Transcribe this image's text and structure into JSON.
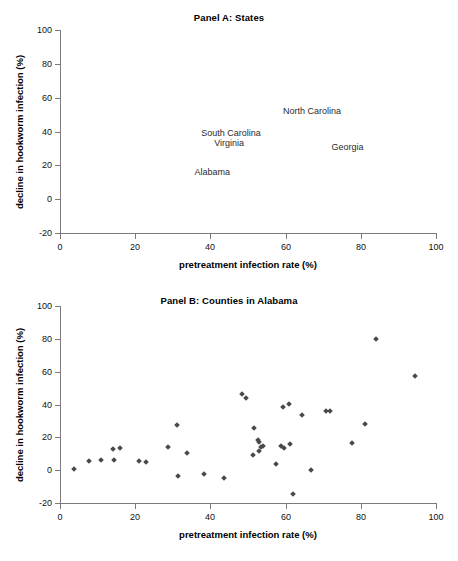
{
  "figure": {
    "panel_a": {
      "title": "Panel A: States",
      "xlabel": "pretreatment infection rate (%)",
      "ylabel": "decline in hookworm infection (%)",
      "xticks": [
        "0",
        "20",
        "40",
        "60",
        "80",
        "100"
      ],
      "yticks": [
        "100",
        "80",
        "60",
        "40",
        "20",
        "0",
        "-20"
      ]
    },
    "panel_b": {
      "title": "Panel B: Counties in Alabama",
      "xlabel": "pretreatment infection rate (%)",
      "ylabel": "decline in hookworm infection (%)",
      "xticks": [
        "0",
        "20",
        "40",
        "60",
        "80",
        "100"
      ],
      "yticks": [
        "100",
        "80",
        "60",
        "40",
        "20",
        "0",
        "-20"
      ]
    }
  },
  "chart_data": [
    {
      "type": "scatter",
      "panel": "A",
      "title": "Panel A: States",
      "xlabel": "pretreatment infection rate (%)",
      "ylabel": "decline in hookworm infection (%)",
      "xlim": [
        0,
        100
      ],
      "ylim": [
        -20,
        100
      ],
      "xticks": [
        0,
        20,
        40,
        60,
        80,
        100
      ],
      "yticks": [
        -20,
        0,
        20,
        40,
        60,
        80,
        100
      ],
      "grid": false,
      "legend": "none",
      "marker": "text-label",
      "points": [
        {
          "label": "North Carolina",
          "x": 67.0,
          "y": 52.0
        },
        {
          "label": "South Carolina",
          "x": 45.5,
          "y": 39.0
        },
        {
          "label": "Virginia",
          "x": 45.0,
          "y": 33.0
        },
        {
          "label": "Georgia",
          "x": 76.5,
          "y": 31.0
        },
        {
          "label": "Alabama",
          "x": 40.5,
          "y": 16.0
        }
      ]
    },
    {
      "type": "scatter",
      "panel": "B",
      "title": "Panel B: Counties in Alabama",
      "xlabel": "pretreatment infection rate (%)",
      "ylabel": "decline in hookworm infection (%)",
      "xlim": [
        0,
        100
      ],
      "ylim": [
        -20,
        100
      ],
      "xticks": [
        0,
        20,
        40,
        60,
        80,
        100
      ],
      "yticks": [
        -20,
        0,
        20,
        40,
        60,
        80,
        100
      ],
      "grid": false,
      "legend": "none",
      "marker": "diamond",
      "x": [
        3.8,
        7.8,
        11.0,
        14.0,
        14.3,
        16.0,
        21.0,
        22.8,
        28.8,
        31.2,
        31.5,
        33.8,
        38.3,
        43.5,
        48.3,
        49.6,
        51.2,
        51.5,
        52.6,
        52.8,
        53.0,
        53.4,
        54.0,
        57.5,
        58.8,
        59.2,
        59.6,
        61.0,
        61.3,
        62.0,
        64.3,
        66.8,
        70.8,
        71.8,
        77.6,
        81.0,
        84.0,
        94.5
      ],
      "y": [
        1.0,
        5.7,
        6.2,
        13.0,
        6.4,
        13.8,
        5.7,
        4.7,
        14.3,
        27.6,
        -3.8,
        10.7,
        -2.2,
        -4.8,
        46.6,
        43.8,
        9.2,
        25.5,
        18.2,
        17.2,
        11.5,
        14.0,
        14.7,
        3.5,
        14.5,
        38.5,
        13.5,
        40.5,
        16.0,
        -14.8,
        33.6,
        0.1,
        36.2,
        36.2,
        16.8,
        28.3,
        80.0,
        57.4
      ]
    }
  ]
}
